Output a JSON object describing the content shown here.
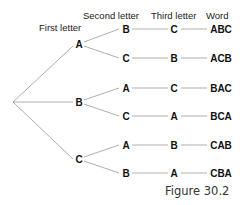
{
  "headers": {
    "first": "First letter",
    "second": "Second letter",
    "third": "Third letter",
    "word": "Word"
  },
  "tree": {
    "first": [
      "A",
      "B",
      "C"
    ],
    "second": [
      "B",
      "C",
      "A",
      "C",
      "A",
      "B"
    ],
    "third": [
      "C",
      "B",
      "C",
      "A",
      "B",
      "A"
    ],
    "words": [
      "ABC",
      "ACB",
      "BAC",
      "BCA",
      "CAB",
      "CBA"
    ]
  },
  "caption": "Figure 30.2"
}
